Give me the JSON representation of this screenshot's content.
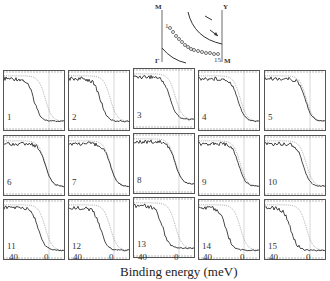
{
  "figure": {
    "xlabel": "Binding energy (meV)",
    "x_ticks": [
      "40",
      "0"
    ],
    "inset": {
      "corner_labels": {
        "top_left": "M",
        "top_right": "Y",
        "bottom_left": "Γ",
        "bottom_right": "M"
      },
      "point_labels": {
        "first": "1",
        "last": "15"
      }
    },
    "panels": [
      {
        "id": "1",
        "label": "1"
      },
      {
        "id": "2",
        "label": "2"
      },
      {
        "id": "3",
        "label": "3"
      },
      {
        "id": "4",
        "label": "4"
      },
      {
        "id": "5",
        "label": "5"
      },
      {
        "id": "6",
        "label": "6"
      },
      {
        "id": "7",
        "label": "7"
      },
      {
        "id": "8",
        "label": "8"
      },
      {
        "id": "9",
        "label": "9"
      },
      {
        "id": "10",
        "label": "10"
      },
      {
        "id": "11",
        "label": "11"
      },
      {
        "id": "12",
        "label": "12"
      },
      {
        "id": "13",
        "label": "13"
      },
      {
        "id": "14",
        "label": "14"
      },
      {
        "id": "15",
        "label": "15"
      }
    ]
  },
  "chart_data": {
    "type": "line",
    "title": "",
    "xlabel": "Binding energy (meV)",
    "ylabel": "",
    "x_ticks": [
      40,
      0
    ],
    "xlim": [
      60,
      -20
    ],
    "grid": false,
    "legend": [],
    "panels": [
      {
        "panel": 1,
        "series": [
          {
            "name": "solid",
            "edge_meV": 20
          },
          {
            "name": "dotted",
            "edge_meV": 5
          }
        ]
      },
      {
        "panel": 2,
        "series": [
          {
            "name": "solid",
            "edge_meV": 18
          },
          {
            "name": "dotted",
            "edge_meV": 5
          }
        ]
      },
      {
        "panel": 3,
        "series": [
          {
            "name": "solid",
            "edge_meV": 12
          },
          {
            "name": "dotted",
            "edge_meV": 5
          }
        ]
      },
      {
        "panel": 4,
        "series": [
          {
            "name": "solid",
            "edge_meV": 8
          },
          {
            "name": "dotted",
            "edge_meV": 5
          }
        ]
      },
      {
        "panel": 5,
        "series": [
          {
            "name": "solid",
            "edge_meV": 6
          },
          {
            "name": "dotted",
            "edge_meV": 5
          }
        ]
      },
      {
        "panel": 6,
        "series": [
          {
            "name": "solid",
            "edge_meV": 5
          },
          {
            "name": "dotted",
            "edge_meV": 5
          }
        ]
      },
      {
        "panel": 7,
        "series": [
          {
            "name": "solid",
            "edge_meV": 5
          },
          {
            "name": "dotted",
            "edge_meV": 5
          }
        ]
      },
      {
        "panel": 8,
        "series": [
          {
            "name": "solid",
            "edge_meV": 5
          },
          {
            "name": "dotted",
            "edge_meV": 5
          }
        ]
      },
      {
        "panel": 9,
        "series": [
          {
            "name": "solid",
            "edge_meV": 7
          },
          {
            "name": "dotted",
            "edge_meV": 5
          }
        ]
      },
      {
        "panel": 10,
        "series": [
          {
            "name": "solid",
            "edge_meV": 9
          },
          {
            "name": "dotted",
            "edge_meV": 5
          }
        ]
      },
      {
        "panel": 11,
        "series": [
          {
            "name": "solid",
            "edge_meV": 14
          },
          {
            "name": "dotted",
            "edge_meV": 5
          }
        ]
      },
      {
        "panel": 12,
        "series": [
          {
            "name": "solid",
            "edge_meV": 18
          },
          {
            "name": "dotted",
            "edge_meV": 5
          }
        ]
      },
      {
        "panel": 13,
        "series": [
          {
            "name": "solid",
            "edge_meV": 22
          },
          {
            "name": "dotted",
            "edge_meV": 5
          }
        ]
      },
      {
        "panel": 14,
        "series": [
          {
            "name": "solid",
            "edge_meV": 24
          },
          {
            "name": "dotted",
            "edge_meV": 5
          }
        ]
      },
      {
        "panel": 15,
        "series": [
          {
            "name": "solid",
            "edge_meV": 26
          },
          {
            "name": "dotted",
            "edge_meV": 5
          }
        ]
      }
    ]
  }
}
